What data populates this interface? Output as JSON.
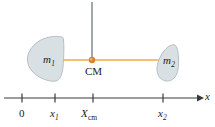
{
  "figure": {
    "background_color": "#ffffff"
  },
  "colors": {
    "blob_fill": "#d9e0e3",
    "blob_stroke": "#b4bfc4",
    "connector_line": "#f0a84a",
    "cm_dot": "#d9832e",
    "axis": "#3a3a3a",
    "vertical_line": "#555f66",
    "text": "#1b1b1b"
  },
  "masses": [
    {
      "id": "mass-1",
      "label": "m",
      "subscript": "1",
      "label_x": 43,
      "label_y": 54
    },
    {
      "id": "mass-2",
      "label": "m",
      "subscript": "2",
      "label_x": 163,
      "label_y": 55
    }
  ],
  "center_of_mass": {
    "label": "CM",
    "label_x": 85,
    "label_y": 66,
    "dot_x": 92,
    "dot_y": 60,
    "dot_radius": 3.2
  },
  "connector": {
    "x1": 60,
    "x2": 160,
    "y": 60
  },
  "vertical_line": {
    "x": 92,
    "y1": 2,
    "y2": 60
  },
  "axis": {
    "name": "x",
    "name_x": 205,
    "name_y": 91,
    "y": 98,
    "x_start": 4,
    "x_end": 202,
    "ticks": [
      {
        "id": "tick-0",
        "label": "0",
        "subscript": "",
        "subscript_italic": false,
        "upright": true,
        "x": 22,
        "label_x": 19,
        "label_y": 108
      },
      {
        "id": "tick-x1",
        "label": "x",
        "subscript": "1",
        "subscript_italic": true,
        "upright": false,
        "x": 55,
        "label_x": 50,
        "label_y": 108
      },
      {
        "id": "tick-xcm",
        "label": "X",
        "subscript": "cm",
        "subscript_italic": false,
        "upright": false,
        "x": 93,
        "label_x": 81,
        "label_y": 108
      },
      {
        "id": "tick-x2",
        "label": "x",
        "subscript": "2",
        "subscript_italic": true,
        "upright": false,
        "x": 163,
        "label_x": 158,
        "label_y": 108
      }
    ]
  }
}
